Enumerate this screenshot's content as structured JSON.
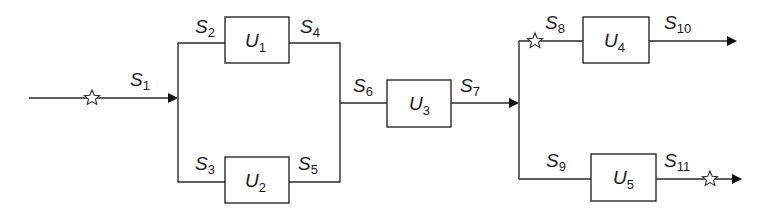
{
  "diagram": {
    "type": "process flow block diagram",
    "units": [
      {
        "id": "U1",
        "letter": "U",
        "sub": "1"
      },
      {
        "id": "U2",
        "letter": "U",
        "sub": "2"
      },
      {
        "id": "U3",
        "letter": "U",
        "sub": "3"
      },
      {
        "id": "U4",
        "letter": "U",
        "sub": "4"
      },
      {
        "id": "U5",
        "letter": "U",
        "sub": "5"
      }
    ],
    "streams": [
      {
        "id": "S1",
        "letter": "S",
        "sub": "1",
        "from": "input",
        "to": "splitter",
        "marked": true
      },
      {
        "id": "S2",
        "letter": "S",
        "sub": "2",
        "from": "splitter",
        "to": "U1"
      },
      {
        "id": "S3",
        "letter": "S",
        "sub": "3",
        "from": "splitter",
        "to": "U2"
      },
      {
        "id": "S4",
        "letter": "S",
        "sub": "4",
        "from": "U1",
        "to": "mixer"
      },
      {
        "id": "S5",
        "letter": "S",
        "sub": "5",
        "from": "U2",
        "to": "mixer"
      },
      {
        "id": "S6",
        "letter": "S",
        "sub": "6",
        "from": "mixer",
        "to": "U3"
      },
      {
        "id": "S7",
        "letter": "S",
        "sub": "7",
        "from": "U3",
        "to": "splitter2"
      },
      {
        "id": "S8",
        "letter": "S",
        "sub": "8",
        "from": "splitter2",
        "to": "U4",
        "marked": true
      },
      {
        "id": "S9",
        "letter": "S",
        "sub": "9",
        "from": "splitter2",
        "to": "U5"
      },
      {
        "id": "S10",
        "letter": "S",
        "sub": "10",
        "from": "U4",
        "to": "output"
      },
      {
        "id": "S11",
        "letter": "S",
        "sub": "11",
        "from": "U5",
        "to": "output",
        "marked": true
      }
    ],
    "marker_symbol": "☆",
    "colors": {
      "line": "#2a2a2a",
      "arrow": "#111111",
      "background": "#ffffff"
    }
  }
}
